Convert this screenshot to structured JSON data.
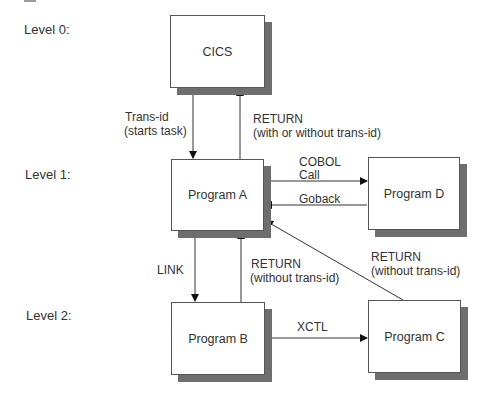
{
  "levels": [
    "Level 0:",
    "Level 1:",
    "Level 2:"
  ],
  "boxes": {
    "cics": "CICS",
    "program_a": "Program A",
    "program_b": "Program B",
    "program_c": "Program C",
    "program_d": "Program D"
  },
  "labels": {
    "trans_id_1": "Trans-id",
    "trans_id_2": "(starts task)",
    "return_top_1": "RETURN",
    "return_top_2": "(with or without trans-id)",
    "cobol_1": "COBOL",
    "cobol_2": "Call",
    "goback": "Goback",
    "link": "LINK",
    "return_b_1": "RETURN",
    "return_b_2": "(without trans-id)",
    "return_c_1": "RETURN",
    "return_c_2": "(without trans-id)",
    "xctl": "XCTL"
  }
}
